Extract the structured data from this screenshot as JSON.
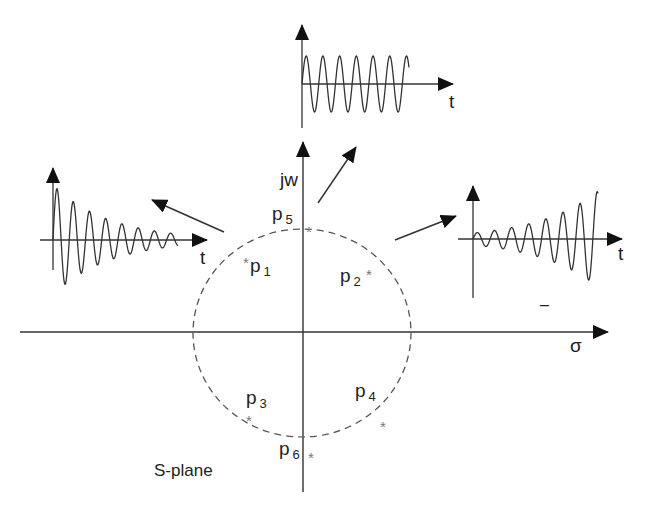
{
  "title": "S-plane",
  "axes": {
    "imag_label": "jw",
    "real_label": "σ",
    "origin": [
      303,
      333
    ],
    "h_axis": {
      "x1": 20,
      "x2": 608,
      "y": 332
    },
    "v_axis": {
      "x": 303,
      "y1": 142,
      "y2": 492
    }
  },
  "circle": {
    "cx": 302,
    "cy": 333,
    "rx": 109,
    "ry": 104,
    "style": "dashed"
  },
  "poles": [
    {
      "name": "p",
      "sub": "1",
      "label_x": 250,
      "label_y": 272,
      "star_x": 243,
      "star_y": 258
    },
    {
      "name": "p",
      "sub": "2",
      "label_x": 340,
      "label_y": 282,
      "star_x": 366,
      "star_y": 270
    },
    {
      "name": "p",
      "sub": "3",
      "label_x": 246,
      "label_y": 404,
      "star_x": 246,
      "star_y": 416
    },
    {
      "name": "p",
      "sub": "4",
      "label_x": 355,
      "label_y": 397,
      "star_x": 380,
      "star_y": 422
    },
    {
      "name": "p",
      "sub": "5",
      "label_x": 272,
      "label_y": 220,
      "star_x": 306,
      "star_y": 227
    },
    {
      "name": "p",
      "sub": "6",
      "label_x": 279,
      "label_y": 455,
      "star_x": 308,
      "star_y": 453
    }
  ],
  "insets": [
    {
      "id": "top",
      "description": "sustained oscillation (poles on jw axis)",
      "origin": [
        302,
        84
      ],
      "y_axis": [
        25,
        128
      ],
      "t_axis_end": 453,
      "t_label": "t",
      "t_label_pos": [
        449,
        108
      ],
      "wave": {
        "x_start": 302,
        "x_end": 409,
        "cycles": 6.4,
        "amp_start": 28,
        "amp_end": 28
      }
    },
    {
      "id": "left",
      "description": "decaying oscillation (poles in left half-plane)",
      "origin": [
        53,
        240
      ],
      "y_axis": [
        168,
        270
      ],
      "t_axis_start": 40,
      "t_axis_end": 207,
      "t_label": "t",
      "t_label_pos": [
        200,
        264
      ],
      "wave": {
        "x_start": 53,
        "x_end": 178,
        "cycles": 7.7,
        "amp_start": 55,
        "amp_end": 6
      }
    },
    {
      "id": "right",
      "description": "growing oscillation (poles in right half-plane)",
      "origin": [
        473,
        239
      ],
      "y_axis": [
        186,
        298
      ],
      "t_axis_start": 458,
      "t_axis_end": 622,
      "t_label": "t",
      "t_label_pos": [
        618,
        260
      ],
      "dash_mark": "–",
      "dash_pos": [
        540,
        310
      ],
      "wave": {
        "x_start": 473,
        "x_end": 598,
        "cycles": 7.3,
        "amp_start": 6,
        "amp_end": 48
      }
    }
  ],
  "arrows": [
    {
      "id": "to-top",
      "x1": 318,
      "y1": 203,
      "x2": 356,
      "y2": 147
    },
    {
      "id": "to-left",
      "x1": 224,
      "y1": 232,
      "x2": 152,
      "y2": 200
    },
    {
      "id": "to-right",
      "x1": 395,
      "y1": 240,
      "x2": 456,
      "y2": 216
    }
  ],
  "colors": {
    "line": "#333333",
    "dash": "#555555",
    "star": "#777777",
    "text": "#222222"
  }
}
